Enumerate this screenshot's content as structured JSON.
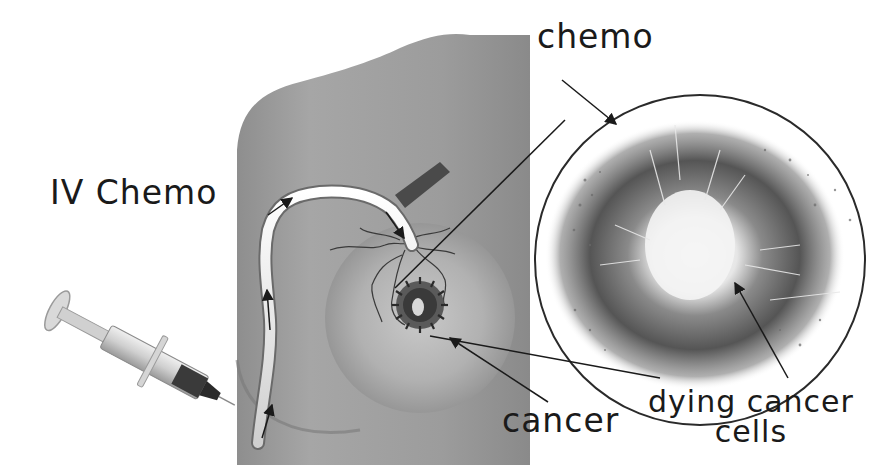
{
  "figure": {
    "type": "medical-illustration"
  },
  "labels": {
    "iv_chemo": "IV Chemo",
    "chemo": "chemo",
    "cancer": "cancer",
    "dying_cancer_cells": [
      "dying cancer",
      "cells"
    ]
  },
  "parts": {
    "syringe": "syringe injecting into arm",
    "vein": "vein with flow arrows carrying chemo",
    "torso": "shoulder and breast",
    "tumor": "tumor in breast",
    "magnified_view": "circular magnification of exploding (dying) cancer cells"
  },
  "colors": {
    "skin": "#9a9a9a",
    "skin_light": "#c4c4c4",
    "vein": "#f2f2f2",
    "ink": "#1a1a1a",
    "background": "#ffffff"
  }
}
